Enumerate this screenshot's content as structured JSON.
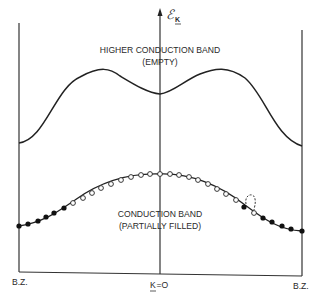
{
  "figure": {
    "axis_label": "ℰ",
    "axis_label_subscript": "K",
    "upper_band": {
      "title": "HIGHER CONDUCTION BAND",
      "subtitle": "(EMPTY)"
    },
    "lower_band": {
      "title": "CONDUCTION BAND",
      "subtitle": "(PARTIALLY FILLED)"
    },
    "x_labels": {
      "left": "B.Z.",
      "center_k": "K",
      "center_rest": "=O",
      "right": "B.Z."
    },
    "colors": {
      "line": "#333333",
      "filled_dot": "#111111",
      "empty_dot": "#ffffff"
    }
  }
}
